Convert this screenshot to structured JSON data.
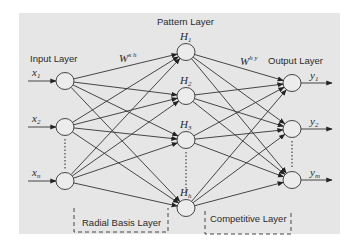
{
  "diagram": {
    "background_color": "#e6e6e6",
    "line_color": "#333333",
    "layers": {
      "input": {
        "label": "Input Layer"
      },
      "pattern": {
        "label": "Pattern Layer"
      },
      "output": {
        "label": "Output Layer"
      },
      "radial_basis": {
        "label": "Radial Basis Layer"
      },
      "competitive": {
        "label": "Competitive Layer"
      }
    },
    "weights": {
      "input_to_hidden": {
        "base": "W",
        "sup": "x h"
      },
      "hidden_to_output": {
        "base": "W",
        "sup": "h y"
      }
    },
    "input_nodes": [
      {
        "base": "x",
        "sub": "1"
      },
      {
        "base": "x",
        "sub": "2"
      },
      {
        "base": "x",
        "sub": "n"
      }
    ],
    "hidden_nodes": [
      {
        "base": "H",
        "sub": "1"
      },
      {
        "base": "H",
        "sub": "2"
      },
      {
        "base": "H",
        "sub": "3"
      },
      {
        "base": "H",
        "sub": "h"
      }
    ],
    "output_nodes": [
      {
        "base": "y",
        "sub": "1"
      },
      {
        "base": "y",
        "sub": "2"
      },
      {
        "base": "y",
        "sub": "m"
      }
    ]
  }
}
